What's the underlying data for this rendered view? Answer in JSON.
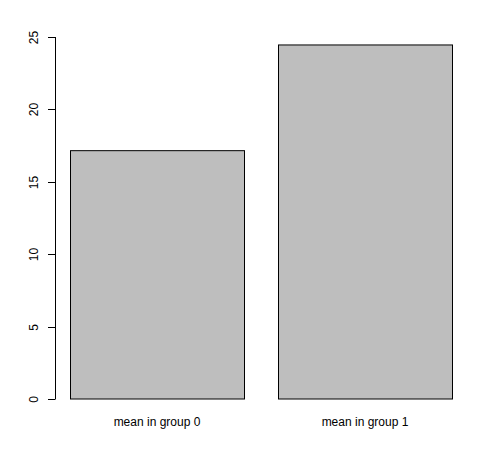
{
  "chart_data": {
    "type": "bar",
    "title": "",
    "xlabel": "",
    "ylabel": "",
    "categories": [
      "mean in group 0",
      "mean in group 1"
    ],
    "values": [
      17.15,
      24.45
    ],
    "ylim": [
      0,
      25
    ],
    "yticks": [
      0,
      5,
      10,
      15,
      20,
      25
    ],
    "ytick_labels": [
      "0",
      "5",
      "10",
      "15",
      "20",
      "25"
    ],
    "grid": false,
    "legend": "none",
    "bar_color": "#bebebe",
    "bar_border_color": "#000000"
  }
}
